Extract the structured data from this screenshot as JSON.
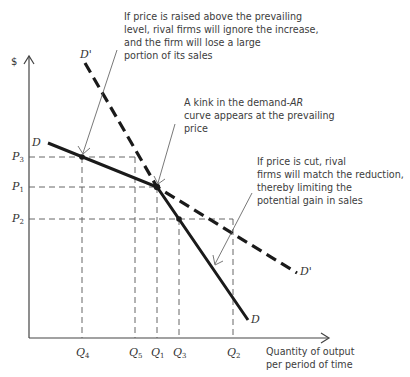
{
  "diagram": {
    "y_axis_label": "$",
    "x_axis_label_line1": "Quantity of output",
    "x_axis_label_line2": "per period of time",
    "curves": {
      "D": {
        "label": "D",
        "style": "solid",
        "points": [
          [
            48,
            143
          ],
          [
            157,
            187
          ],
          [
            248,
            320
          ]
        ]
      },
      "D_prime": {
        "label": "D'",
        "style": "dashed",
        "points": [
          [
            85,
            63
          ],
          [
            157,
            187
          ],
          [
            297,
            273
          ]
        ]
      }
    },
    "price_ticks": [
      {
        "name": "P",
        "sub": "3",
        "y": 157
      },
      {
        "name": "P",
        "sub": "1",
        "y": 187
      },
      {
        "name": "P",
        "sub": "2",
        "y": 219
      }
    ],
    "quantity_ticks": [
      {
        "name": "Q",
        "sub": "4",
        "x": 82
      },
      {
        "name": "Q",
        "sub": "5",
        "x": 135
      },
      {
        "name": "Q",
        "sub": "1",
        "x": 157
      },
      {
        "name": "Q",
        "sub": "3",
        "x": 179
      },
      {
        "name": "Q",
        "sub": "2",
        "x": 233
      }
    ],
    "annotations": {
      "raise": {
        "line1": "If price is raised above the prevailing",
        "line2": "level, rival firms will ignore the increase,",
        "line3": "and the firm will lose a large",
        "line4": "portion of its sales"
      },
      "kink": {
        "line1": "A kink in the demand-",
        "line1_italic": "AR",
        "line2": "curve appears at the prevailing",
        "line3": "price"
      },
      "cut": {
        "line1": "If price is cut, rival",
        "line2": "firms will match the reduction,",
        "line3": "thereby limiting the",
        "line4": "potential gain in sales"
      }
    },
    "colors": {
      "curve": "#1a1a1a",
      "guide": "#555555",
      "axis": "#444444",
      "text": "#333333"
    }
  }
}
